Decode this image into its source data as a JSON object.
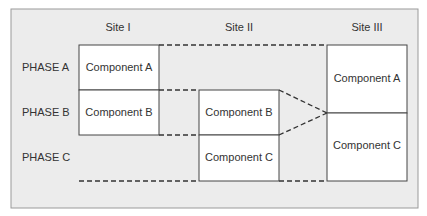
{
  "sites": [
    {
      "label": "Site I"
    },
    {
      "label": "Site II"
    },
    {
      "label": "Site III"
    }
  ],
  "phases": [
    {
      "label": "PHASE A"
    },
    {
      "label": "PHASE B"
    },
    {
      "label": "PHASE C"
    }
  ],
  "site1": {
    "components": [
      {
        "label": "Component A"
      },
      {
        "label": "Component B"
      }
    ]
  },
  "site2": {
    "components": [
      {
        "label": "Component B"
      },
      {
        "label": "Component C"
      }
    ]
  },
  "site3": {
    "components": [
      {
        "label": "Component A"
      },
      {
        "label": "Component C"
      }
    ]
  },
  "colors": {
    "panel_bg": "#ececec",
    "panel_border": "#9a9a9a",
    "box_bg": "#ffffff",
    "line": "#444444",
    "text": "#333333"
  }
}
